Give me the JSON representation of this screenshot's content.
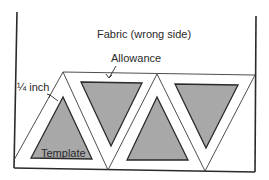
{
  "diagram": {
    "title": "Fabric (wrong side)",
    "labels": {
      "allowance": "Allowance",
      "seam_width": "¼ inch",
      "template": "Template"
    },
    "colors": {
      "line": "#2a2a2a",
      "template_fill": "#a8a8a8",
      "fabric": "#ffffff"
    },
    "elements": {
      "fabric_piece": "fabric rectangle (wrong side)",
      "templates_upright": 2,
      "templates_inverted": 2,
      "allowance_strips": "¼ inch seam allowance around each triangle template"
    }
  }
}
